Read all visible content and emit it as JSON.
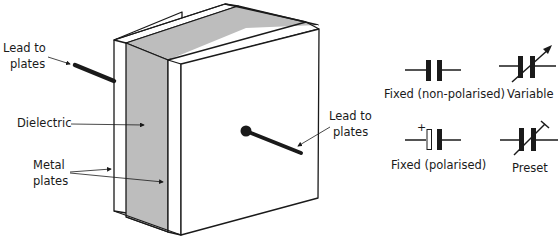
{
  "diagram": {
    "colors": {
      "outline": "#1a1a1a",
      "dielectric": "#bdbdbd",
      "plate": "#ffffff",
      "lead": "#1a1a1a"
    },
    "labels": {
      "lead_left": [
        "Lead to",
        "plates"
      ],
      "dielectric": "Dielectric",
      "metal_plates": [
        "Metal",
        "plates"
      ],
      "lead_right": [
        "Lead to",
        "plates"
      ]
    },
    "symbols": [
      {
        "id": "fixed-non-polarised",
        "label": "Fixed (non-polarised)"
      },
      {
        "id": "variable",
        "label": "Variable"
      },
      {
        "id": "fixed-polarised",
        "label": "Fixed (polarised)",
        "marker": "+"
      },
      {
        "id": "preset",
        "label": "Preset"
      }
    ]
  }
}
